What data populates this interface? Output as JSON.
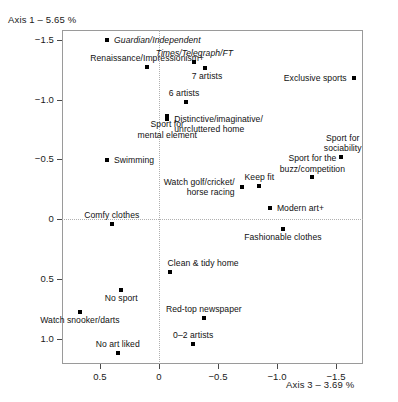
{
  "chart_data": {
    "type": "scatter",
    "title": "",
    "ylabel": "Axis 1 – 5.65 %",
    "xlabel": "Axis 3 – 3.69 %",
    "xlim": [
      0.82,
      -1.72
    ],
    "ylim": [
      -1.65,
      1.17
    ],
    "x_ticks": [
      0.5,
      0,
      -0.5,
      -1.0,
      -1.5
    ],
    "x_tick_labels": [
      "0.5",
      "0",
      "−0.5",
      "−1.0",
      "−1.5"
    ],
    "y_ticks": [
      -1.5,
      -1.0,
      -0.5,
      0,
      0.5,
      1.0
    ],
    "y_tick_labels": [
      "−1.5",
      "−1.0",
      "−0.5",
      "0",
      "0.5",
      "1.0"
    ],
    "grid": false,
    "zero_lines": true,
    "legend": "none",
    "note": "y axis is inverted: negative values at top",
    "points": [
      {
        "label": "Guardian/Independent",
        "x": 0.44,
        "y": -1.5,
        "italic": true,
        "lx": 7,
        "ly": -5,
        "align": "left"
      },
      {
        "label": "Renaissance/Impressionism+",
        "x": 0.1,
        "y": -1.27,
        "italic": false,
        "lx": 0,
        "ly": -14,
        "align": "center"
      },
      {
        "label": "7 artists",
        "x": -0.39,
        "y": -1.26,
        "italic": false,
        "lx": 2,
        "ly": 3,
        "align": "center"
      },
      {
        "label": "6 artists",
        "x": -0.23,
        "y": -0.98,
        "italic": false,
        "lx": -2,
        "ly": -14,
        "align": "center"
      },
      {
        "label": "Sport for\nmental element",
        "x": -0.07,
        "y": -0.86,
        "italic": false,
        "lx": 0,
        "ly": 3,
        "align": "center"
      },
      {
        "label": "Swimming",
        "x": 0.44,
        "y": -0.49,
        "italic": false,
        "lx": 7,
        "ly": -5,
        "align": "left"
      },
      {
        "label": "Comfy clothes",
        "x": 0.4,
        "y": 0.04,
        "italic": false,
        "lx": 0,
        "ly": -14,
        "align": "center"
      },
      {
        "label": "Times/Telegraph/FT",
        "x": -0.3,
        "y": -1.31,
        "italic": true,
        "lx": 0,
        "ly": -14,
        "align": "center"
      },
      {
        "label": "Exclusive sports",
        "x": -1.65,
        "y": -1.18,
        "italic": false,
        "lx": -7,
        "ly": -5,
        "align": "right"
      },
      {
        "label": "Distinctive/imaginative/\nunrcluttered home",
        "x": -0.07,
        "y": -0.84,
        "italic": false,
        "lx": 7,
        "ly": -5,
        "align": "left"
      },
      {
        "label": "Sport for\nsociability",
        "x": -1.54,
        "y": -0.52,
        "italic": false,
        "lx": 2,
        "ly": -24,
        "align": "center"
      },
      {
        "label": "Sport for the\nbuzz/competition",
        "x": -1.3,
        "y": -0.35,
        "italic": false,
        "lx": 0,
        "ly": -24,
        "align": "center"
      },
      {
        "label": "Keep fit",
        "x": -0.85,
        "y": -0.28,
        "italic": false,
        "lx": 0,
        "ly": -14,
        "align": "center"
      },
      {
        "label": "Watch golf/cricket/\nhorse racing",
        "x": -0.7,
        "y": -0.27,
        "italic": false,
        "lx": -7,
        "ly": -10,
        "align": "right"
      },
      {
        "label": "Modern art+",
        "x": -0.94,
        "y": -0.09,
        "italic": false,
        "lx": 7,
        "ly": -5,
        "align": "left"
      },
      {
        "label": "Fashionable clothes",
        "x": -1.05,
        "y": 0.08,
        "italic": false,
        "lx": 0,
        "ly": 3,
        "align": "center"
      },
      {
        "label": "Clean & tidy home",
        "x": -0.09,
        "y": 0.44,
        "italic": false,
        "lx": -2,
        "ly": -14,
        "align": "left"
      },
      {
        "label": "No sport",
        "x": 0.32,
        "y": 0.59,
        "italic": false,
        "lx": 0,
        "ly": 3,
        "align": "center"
      },
      {
        "label": "Red-top newspaper",
        "x": -0.38,
        "y": 0.83,
        "italic": false,
        "lx": 0,
        "ly": -14,
        "align": "center"
      },
      {
        "label": "Watch snooker/darts",
        "x": 0.67,
        "y": 0.78,
        "italic": false,
        "lx": 0,
        "ly": 3,
        "align": "center"
      },
      {
        "label": "0–2 artists",
        "x": -0.29,
        "y": 1.05,
        "italic": false,
        "lx": 0,
        "ly": -14,
        "align": "center"
      },
      {
        "label": "No art liked",
        "x": 0.35,
        "y": 1.12,
        "italic": false,
        "lx": 0,
        "ly": -14,
        "align": "center"
      }
    ]
  }
}
